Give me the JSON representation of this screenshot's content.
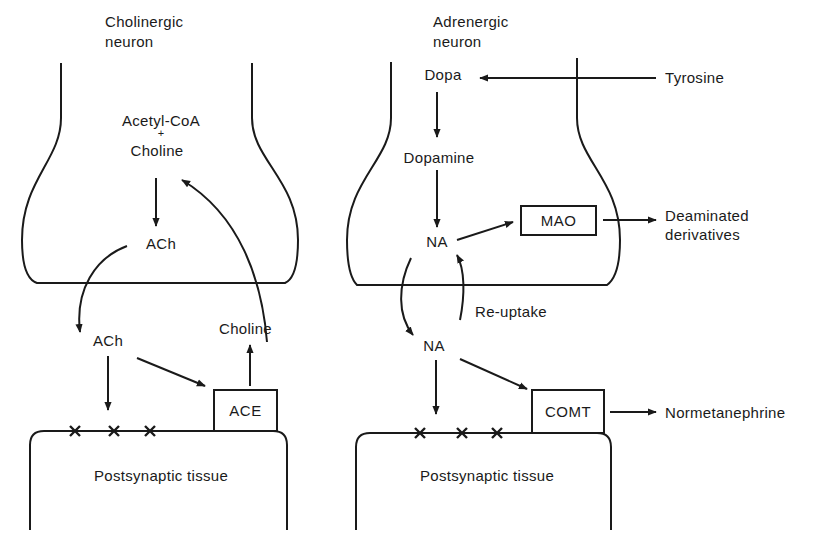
{
  "stroke_color": "#1a1a1a",
  "cholinergic": {
    "neuron_label_line1": "Cholinergic",
    "neuron_label_line2": "neuron",
    "precursor_line1": "Acetyl-CoA",
    "precursor_plus": "+",
    "precursor_line2": "Choline",
    "ach_inside": "ACh",
    "ach_cleft": "ACh",
    "choline_cleft": "Choline",
    "enzyme": "ACE",
    "postsynaptic": "Postsynaptic tissue"
  },
  "adrenergic": {
    "neuron_label_line1": "Adrenergic",
    "neuron_label_line2": "neuron",
    "tyrosine": "Tyrosine",
    "dopa": "Dopa",
    "dopamine": "Dopamine",
    "na_inside": "NA",
    "mao": "MAO",
    "deaminated_line1": "Deaminated",
    "deaminated_line2": "derivatives",
    "reuptake": "Re-uptake",
    "na_cleft": "NA",
    "comt": "COMT",
    "normetanephrine": "Normetanephrine",
    "postsynaptic": "Postsynaptic tissue"
  }
}
